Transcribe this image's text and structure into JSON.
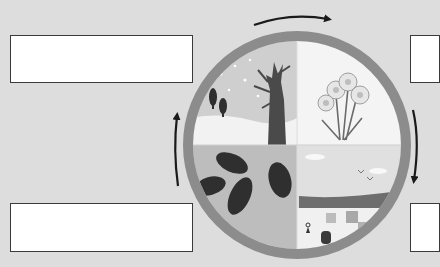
{
  "diagram": {
    "type": "seasons-cycle",
    "quadrants": [
      {
        "position": "top-left",
        "season_depicted": "winter",
        "scene": "bare tree, snow, small evergreen trees"
      },
      {
        "position": "top-right",
        "season_depicted": "spring",
        "scene": "daffodils"
      },
      {
        "position": "bottom-right",
        "season_depicted": "summer",
        "scene": "beach, sea, birds, sand"
      },
      {
        "position": "bottom-left",
        "season_depicted": "autumn",
        "scene": "fallen leaves"
      }
    ],
    "arrows": [
      {
        "position": "top",
        "direction": "clockwise"
      },
      {
        "position": "right",
        "direction": "clockwise"
      },
      {
        "position": "left",
        "direction": "clockwise"
      }
    ],
    "label_boxes": [
      {
        "position": "top-left",
        "text": ""
      },
      {
        "position": "top-right",
        "text": ""
      },
      {
        "position": "bottom-left",
        "text": ""
      },
      {
        "position": "bottom-right",
        "text": ""
      }
    ],
    "colors": {
      "background": "#dddddd",
      "ring": "#8c8c8c",
      "arrow": "#1a1a1a",
      "box_border": "#3a3a3a"
    }
  }
}
